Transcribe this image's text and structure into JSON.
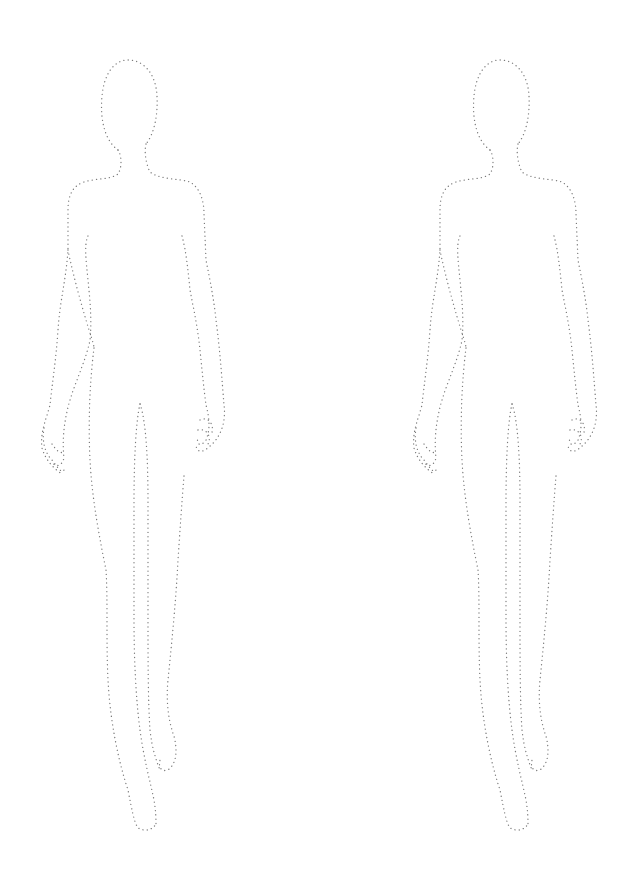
{
  "page": {
    "background": "#ffffff",
    "stroke_color": "#7a7a7a",
    "style": "dotted-outline"
  },
  "figures": [
    {
      "id": "left",
      "label": "croquis-figure-left",
      "offset_x": 0
    },
    {
      "id": "right",
      "label": "croquis-figure-right",
      "offset_x": 372
    }
  ]
}
